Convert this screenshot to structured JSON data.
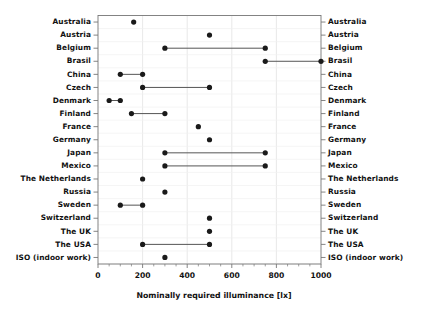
{
  "chart_data": {
    "type": "scatter",
    "title": "",
    "subtitle": "",
    "xlabel": "Nominally required illuminance  [lx]",
    "ylabel": "",
    "xlim": [
      0,
      1000
    ],
    "xticks": [
      0,
      200,
      400,
      600,
      800,
      1000
    ],
    "xtick_labels": [
      "0",
      "200",
      "400",
      "600",
      "800",
      "1000"
    ],
    "minor_tick_step": 50,
    "grid": "vertical-and-horizontal-light",
    "legend": "none",
    "orientation": "horizontal-dumbbell",
    "left_axis_labels_shown": true,
    "right_axis_labels_shown": true,
    "categories": [
      "Australia",
      "Austria",
      "Belgium",
      "Brasil",
      "China",
      "Czech",
      "Denmark",
      "Finland",
      "France",
      "Germany",
      "Japan",
      "Mexico",
      "The Netherlands",
      "Russia",
      "Sweden",
      "Switzerland",
      "The UK",
      "The USA",
      "ISO (indoor work)"
    ],
    "rows": [
      {
        "category": "Australia",
        "low": 160,
        "high": 160
      },
      {
        "category": "Austria",
        "low": 500,
        "high": 500
      },
      {
        "category": "Belgium",
        "low": 300,
        "high": 750
      },
      {
        "category": "Brasil",
        "low": 750,
        "high": 1000
      },
      {
        "category": "China",
        "low": 100,
        "high": 200
      },
      {
        "category": "Czech",
        "low": 200,
        "high": 500
      },
      {
        "category": "Denmark",
        "low": 50,
        "high": 100
      },
      {
        "category": "Finland",
        "low": 150,
        "high": 300
      },
      {
        "category": "France",
        "low": 450,
        "high": 450
      },
      {
        "category": "Germany",
        "low": 500,
        "high": 500
      },
      {
        "category": "Japan",
        "low": 300,
        "high": 750
      },
      {
        "category": "Mexico",
        "low": 300,
        "high": 750
      },
      {
        "category": "The Netherlands",
        "low": 200,
        "high": 200
      },
      {
        "category": "Russia",
        "low": 300,
        "high": 300
      },
      {
        "category": "Sweden",
        "low": 100,
        "high": 200
      },
      {
        "category": "Switzerland",
        "low": 500,
        "high": 500
      },
      {
        "category": "The UK",
        "low": 500,
        "high": 500
      },
      {
        "category": "The USA",
        "low": 200,
        "high": 500
      },
      {
        "category": "ISO (indoor work)",
        "low": 300,
        "high": 300
      }
    ],
    "colors": {
      "marker": "#1a1a1a",
      "connector": "#555555",
      "axis": "#777777",
      "grid": "#e2e2e2",
      "background": "#ffffff",
      "text": "#111111"
    }
  }
}
